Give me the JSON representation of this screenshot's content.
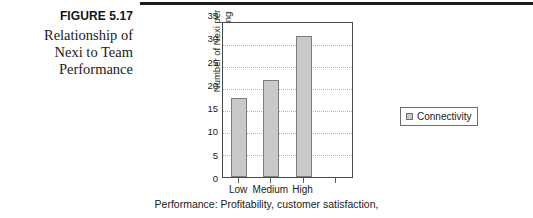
{
  "figure": {
    "number": "FIGURE 5.17",
    "title_lines": [
      "Relationship of",
      "Nexi to Team",
      "Performance"
    ]
  },
  "chart_data": {
    "type": "bar",
    "title": "",
    "categories": [
      "Low",
      "Medium",
      "High"
    ],
    "values": [
      18,
      22,
      32
    ],
    "series": [
      {
        "name": "Connectivity",
        "values": [
          18,
          22,
          32
        ]
      }
    ],
    "xlabel": "Performance: Profitability, customer satisfaction,",
    "ylabel_lines": [
      "Number of Nexi per",
      "50-minute meeting"
    ],
    "ylim": [
      0,
      35
    ],
    "yticks": [
      0,
      5,
      10,
      15,
      20,
      25,
      30,
      35
    ],
    "ytick_labels": [
      "0",
      "5",
      "10",
      "15",
      "20",
      "25",
      "30",
      "35"
    ],
    "grid": true,
    "legend_position": "right",
    "legend_entries": [
      "Connectivity"
    ],
    "bar_color": "#c9c9c9",
    "bar_border_color": "#7d7d7d",
    "gridline_color": "#b4b4b4",
    "axis_color": "#4a4a4a"
  }
}
